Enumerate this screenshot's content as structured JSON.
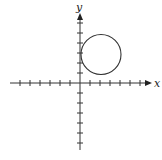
{
  "figure": {
    "type": "coordinate-plane-with-circle",
    "axes": {
      "x_label": "x",
      "y_label": "y",
      "x_ticks_negative": 7,
      "x_ticks_positive": 6,
      "y_ticks_positive": 6,
      "y_ticks_negative": 6,
      "tick_unit": 1
    },
    "circle": {
      "center": [
        2,
        3
      ],
      "radius": 2
    },
    "colors": {
      "line": "#333333",
      "background": "#ffffff"
    }
  }
}
